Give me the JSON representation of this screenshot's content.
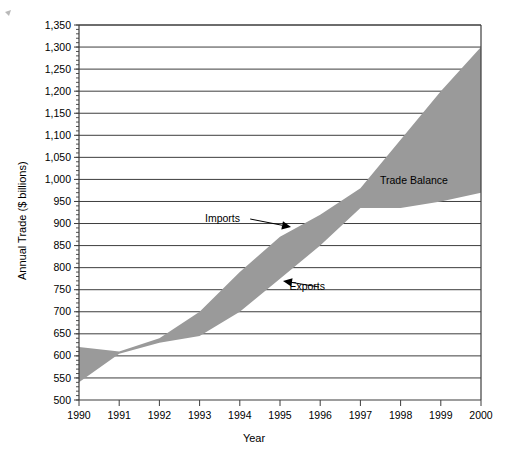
{
  "chart_data": {
    "type": "area",
    "title": "",
    "xlabel": "Year",
    "ylabel": "Annual Trade ($ billions)",
    "x": [
      1990,
      1991,
      1992,
      1993,
      1994,
      1995,
      1996,
      1997,
      1998,
      1999,
      2000
    ],
    "xtick_labels": [
      "1990",
      "1991",
      "1992",
      "1993",
      "1994",
      "1995",
      "1996",
      "1997",
      "1998",
      "1999",
      "2000"
    ],
    "ytick_labels": [
      "500",
      "550",
      "600",
      "650",
      "700",
      "750",
      "800",
      "850",
      "900",
      "950",
      "1,000",
      "1,050",
      "1,100",
      "1,150",
      "1,200",
      "1,250",
      "1,300",
      "1,350"
    ],
    "ytick_values": [
      500,
      550,
      600,
      650,
      700,
      750,
      800,
      850,
      900,
      950,
      1000,
      1050,
      1100,
      1150,
      1200,
      1250,
      1300,
      1350
    ],
    "ylim": [
      500,
      1350
    ],
    "xlim": [
      1990,
      2000
    ],
    "grid": true,
    "legend_position": "inline-annotations",
    "band_color": "#9a9a9a",
    "series": [
      {
        "name": "Imports",
        "values": [
          620,
          610,
          640,
          700,
          790,
          870,
          920,
          980,
          1090,
          1200,
          1300
        ]
      },
      {
        "name": "Exports",
        "values": [
          540,
          605,
          630,
          645,
          700,
          775,
          850,
          935,
          935,
          950,
          970
        ]
      }
    ],
    "annotations": [
      {
        "label": "Imports",
        "text_x": 205,
        "text_y": 222,
        "arrow_to_x": 291,
        "arrow_to_y": 227
      },
      {
        "label": "Exports",
        "text_x": 325,
        "text_y": 290,
        "arrow_to_x": 283,
        "arrow_to_y": 281
      },
      {
        "label": "Trade Balance",
        "text_x": 380,
        "text_y": 184,
        "arrow_to_x": null,
        "arrow_to_y": null
      }
    ]
  },
  "axis": {
    "y_title": "Annual Trade ($ billions)",
    "x_title": "Year"
  }
}
